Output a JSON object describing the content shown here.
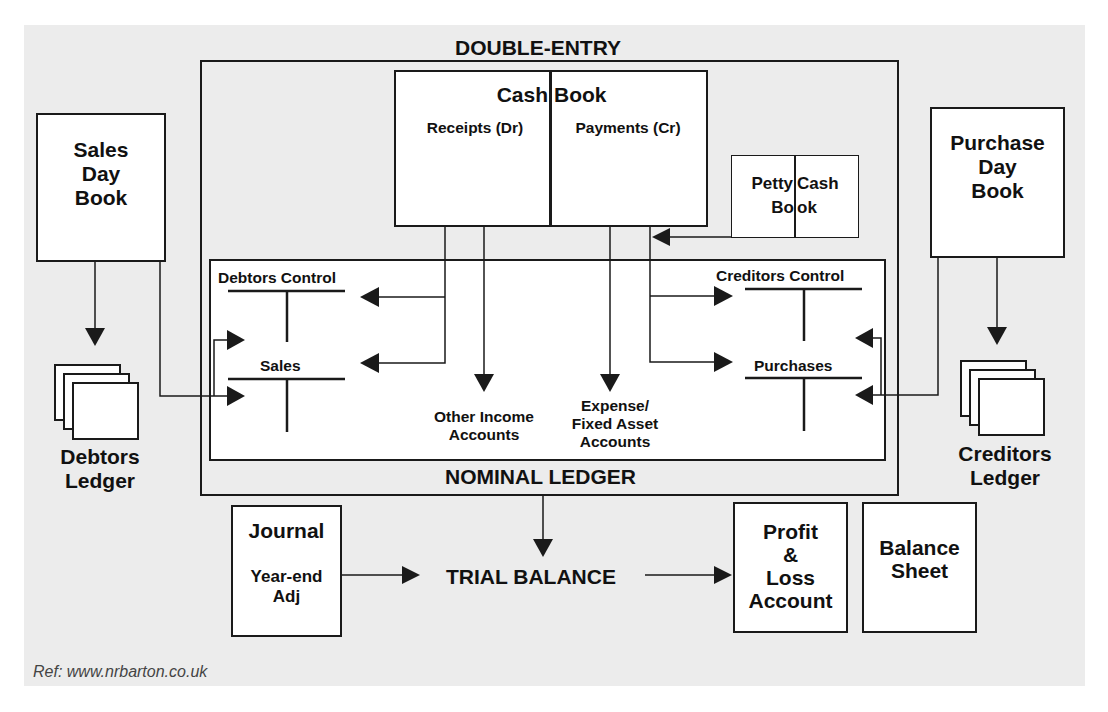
{
  "title": "DOUBLE-ENTRY",
  "sales_day_book": {
    "lines": [
      "Sales",
      "Day",
      "Book"
    ]
  },
  "purchase_day_book": {
    "lines": [
      "Purchase",
      "Day",
      "Book"
    ]
  },
  "cash_book": {
    "title_left": "Cash",
    "title_right": "Book",
    "left_col": "Receipts (Dr)",
    "right_col": "Payments (Cr)"
  },
  "petty_cash_book": {
    "left": "Petty",
    "right": "Cash",
    "bottom_left": "Bo",
    "bottom_right": "ok"
  },
  "nominal_ledger": {
    "label": "NOMINAL LEDGER",
    "accounts": {
      "debtors_control": "Debtors Control",
      "sales": "Sales",
      "creditors_control": "Creditors Control",
      "purchases": "Purchases",
      "other_income": [
        "Other Income",
        "Accounts"
      ],
      "expense": [
        "Expense/",
        "Fixed Asset",
        "Accounts"
      ]
    }
  },
  "debtors_ledger": {
    "lines": [
      "Debtors",
      "Ledger"
    ]
  },
  "creditors_ledger": {
    "lines": [
      "Creditors",
      "Ledger"
    ]
  },
  "journal": {
    "title": "Journal",
    "sub": [
      "Year-end",
      "Adj"
    ]
  },
  "trial_balance": "TRIAL BALANCE",
  "profit_loss": {
    "lines": [
      "Profit",
      "&",
      "Loss",
      "Account"
    ]
  },
  "balance_sheet": {
    "lines": [
      "Balance",
      "Sheet"
    ]
  },
  "reference": "Ref: www.nrbarton.co.uk",
  "colors": {
    "background": "#ececec",
    "box_fill": "#ffffff",
    "line": "#1a1a1a"
  }
}
